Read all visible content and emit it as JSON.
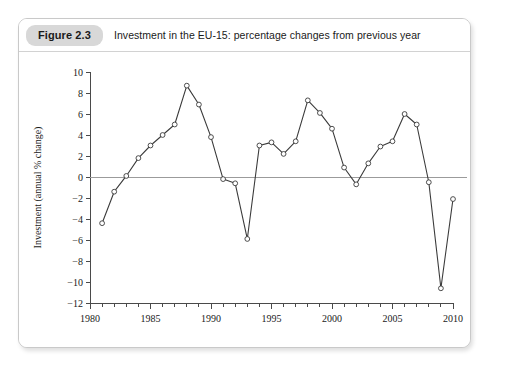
{
  "figure": {
    "badge": "Figure 2.3",
    "caption": "Investment in the EU-15: percentage changes from previous year"
  },
  "colors": {
    "card_border": "#c9c9c9",
    "badge_background": "#d8d8d8",
    "axis": "#4a4a4a",
    "zero_line": "#9b9b9b",
    "series": "#3b3b3b",
    "marker_fill": "#ffffff",
    "page_background": "#ffffff"
  },
  "chart_data": {
    "type": "line",
    "title": "Investment in the EU-15: percentage changes from previous year",
    "xlabel": "",
    "ylabel": "Investment (annual % change)",
    "xlim": [
      1980,
      2010
    ],
    "ylim": [
      -12,
      10
    ],
    "ytick_step": 2,
    "yticks": [
      -12,
      -10,
      -8,
      -6,
      -4,
      -2,
      0,
      2,
      4,
      6,
      8,
      10
    ],
    "ytick_labels": [
      "-12",
      "-10",
      "-8",
      "-6",
      "-4",
      "-2",
      "0",
      "2",
      "4",
      "6",
      "8",
      "10"
    ],
    "xticks_major": [
      1980,
      1985,
      1990,
      1995,
      2000,
      2005,
      2010
    ],
    "xtick_labels": [
      "1980",
      "1985",
      "1990",
      "1995",
      "2000",
      "2005",
      "2010"
    ],
    "xticks_minor_step": 1,
    "grid": false,
    "legend": null,
    "zero_reference_line": 0,
    "marker": "open-circle",
    "x": [
      1981,
      1982,
      1983,
      1984,
      1985,
      1986,
      1987,
      1988,
      1989,
      1990,
      1991,
      1992,
      1993,
      1994,
      1995,
      1996,
      1997,
      1998,
      1999,
      2000,
      2001,
      2002,
      2003,
      2004,
      2005,
      2006,
      2007,
      2008,
      2009,
      2010
    ],
    "values": [
      -4.4,
      -1.4,
      0.1,
      1.8,
      3.0,
      4.0,
      5.0,
      8.7,
      6.9,
      3.8,
      -0.2,
      -0.6,
      -5.9,
      3.0,
      3.3,
      2.2,
      3.4,
      7.3,
      6.1,
      4.6,
      0.9,
      -0.7,
      1.3,
      2.9,
      3.4,
      6.0,
      5.0,
      -0.5,
      -10.6,
      -2.1
    ]
  }
}
